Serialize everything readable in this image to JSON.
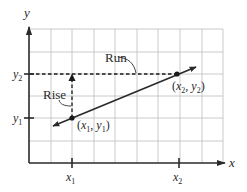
{
  "diagram": {
    "axes": {
      "x_label": "x",
      "y_label": "y"
    },
    "ticks": {
      "x": [
        {
          "id": "x1",
          "base": "x",
          "sub": "1",
          "px": 72
        },
        {
          "id": "x2",
          "base": "x",
          "sub": "2",
          "px": 179
        }
      ],
      "y": [
        {
          "id": "y1",
          "base": "y",
          "sub": "1",
          "py": 118
        },
        {
          "id": "y2",
          "base": "y",
          "sub": "2",
          "py": 74
        }
      ]
    },
    "points": [
      {
        "id": "p1",
        "label_open": "(",
        "x_base": "x",
        "x_sub": "1",
        "sep": ", ",
        "y_base": "y",
        "y_sub": "1",
        "label_close": ")",
        "px": 72,
        "py": 118
      },
      {
        "id": "p2",
        "label_open": "(",
        "x_base": "x",
        "x_sub": "2",
        "sep": ", ",
        "y_base": "y",
        "y_sub": "2",
        "label_close": ")",
        "px": 177,
        "py": 74
      }
    ],
    "annotations": {
      "rise": "Rise",
      "run": "Run"
    },
    "grid": {
      "vertical_px": [
        51,
        72,
        94,
        115,
        137,
        158,
        180,
        202,
        223
      ],
      "horizontal_px": [
        29,
        52,
        74,
        96,
        118,
        141
      ],
      "color": "#bdbdbd"
    },
    "colors": {
      "ink": "#2a2a2a",
      "grid": "#bdbdbd",
      "background": "#ffffff"
    }
  }
}
